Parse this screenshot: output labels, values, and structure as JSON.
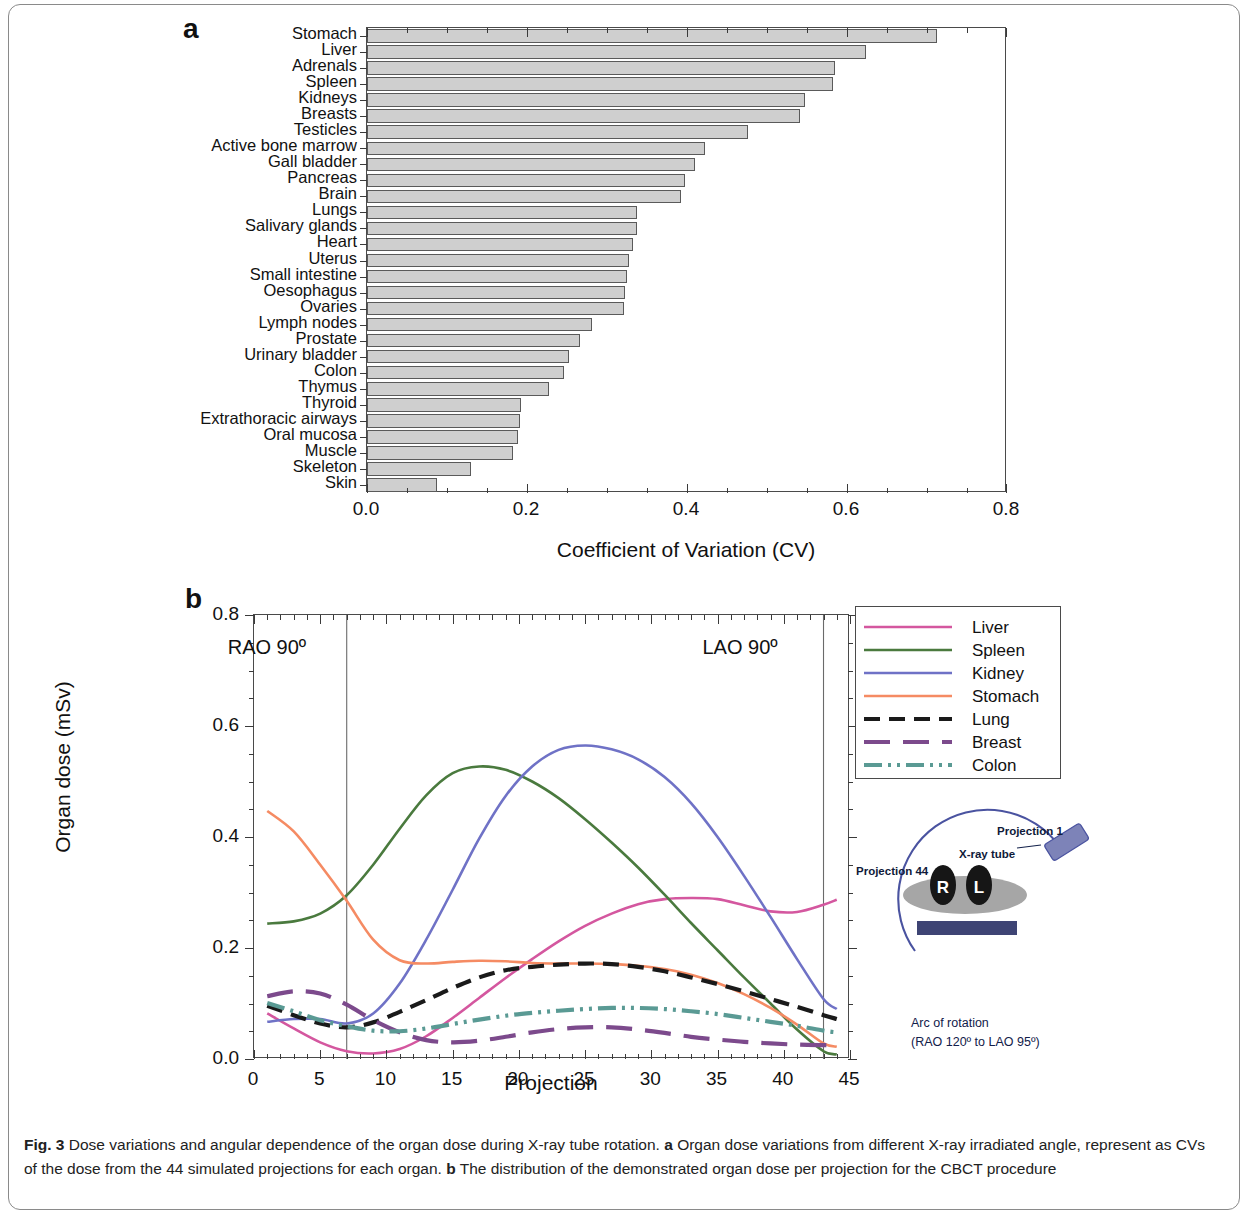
{
  "figure": {
    "caption_label": "Fig. 3",
    "caption_text": " Dose variations and angular dependence of the organ dose during X-ray tube rotation. ",
    "caption_a_label": "a",
    "caption_a_text": " Organ dose variations from different X-ray irradiated angle, represent as CVs of the dose from the 44 simulated projections for each organ. ",
    "caption_b_label": "b",
    "caption_b_text": " The distribution of the demonstrated organ dose per projection for the CBCT procedure"
  },
  "panel_a": {
    "letter": "a",
    "bar_color": "#cfcfcf",
    "bar_edge": "#5a5a5a"
  },
  "panel_b": {
    "letter": "b",
    "annotations": [
      {
        "text": "RAO 90º",
        "projection": 7
      },
      {
        "text": "LAO 90º",
        "projection": 43
      }
    ],
    "inset": {
      "projection1_label": "Projection 1",
      "projection44_label": "Projection 44",
      "xray_tube_label": "X-ray tube",
      "right_marker": "R",
      "left_marker": "L",
      "arc_label_line1": "Arc of rotation",
      "arc_label_line2": "(RAO 120º to LAO 95º)"
    }
  },
  "chart_data": [
    {
      "type": "bar",
      "orientation": "horizontal",
      "title": "",
      "xlabel": "Coefficient of Variation (CV)",
      "ylabel": "",
      "xlim": [
        0.0,
        0.8
      ],
      "xticks": [
        "0.0",
        "0.2",
        "0.4",
        "0.6",
        "0.8"
      ],
      "xtick_values": [
        0.0,
        0.2,
        0.4,
        0.6,
        0.8
      ],
      "grid": false,
      "categories": [
        "Stomach",
        "Liver",
        "Adrenals",
        "Spleen",
        "Kidneys",
        "Breasts",
        "Testicles",
        "Active bone marrow",
        "Gall bladder",
        "Pancreas",
        "Brain",
        "Lungs",
        "Salivary glands",
        "Heart",
        "Uterus",
        "Small intestine",
        "Oesophagus",
        "Ovaries",
        "Lymph nodes",
        "Prostate",
        "Urinary bladder",
        "Colon",
        "Thymus",
        "Thyroid",
        "Extrathoracic airways",
        "Oral mucosa",
        "Muscle",
        "Skeleton",
        "Skin"
      ],
      "values": [
        0.713,
        0.624,
        0.585,
        0.583,
        0.548,
        0.541,
        0.476,
        0.422,
        0.41,
        0.398,
        0.392,
        0.338,
        0.337,
        0.332,
        0.327,
        0.325,
        0.322,
        0.321,
        0.281,
        0.266,
        0.252,
        0.246,
        0.228,
        0.193,
        0.191,
        0.189,
        0.182,
        0.13,
        0.088
      ]
    },
    {
      "type": "line",
      "title": "",
      "xlabel": "Projection",
      "ylabel": "Organ dose (mSv)",
      "xlim": [
        0,
        45
      ],
      "ylim": [
        0.0,
        0.8
      ],
      "xticks": [
        "0",
        "5",
        "10",
        "15",
        "20",
        "25",
        "30",
        "35",
        "40",
        "45"
      ],
      "xtick_values": [
        0,
        5,
        10,
        15,
        20,
        25,
        30,
        35,
        40,
        45
      ],
      "yticks": [
        "0.0",
        "0.2",
        "0.4",
        "0.6",
        "0.8"
      ],
      "ytick_values": [
        0.0,
        0.2,
        0.4,
        0.6,
        0.8
      ],
      "grid": false,
      "legend_position": "right-top",
      "x": [
        1,
        3,
        5,
        7,
        9,
        11,
        13,
        15,
        17,
        19,
        21,
        23,
        25,
        27,
        29,
        31,
        33,
        35,
        37,
        39,
        41,
        43,
        44
      ],
      "series": [
        {
          "name": "Liver",
          "color": "#d4579f",
          "style": "solid",
          "values": [
            0.082,
            0.055,
            0.03,
            0.014,
            0.01,
            0.018,
            0.041,
            0.074,
            0.11,
            0.146,
            0.18,
            0.212,
            0.24,
            0.262,
            0.279,
            0.288,
            0.29,
            0.288,
            0.277,
            0.266,
            0.265,
            0.278,
            0.287
          ]
        },
        {
          "name": "Spleen",
          "color": "#4a7a3e",
          "style": "solid",
          "values": [
            0.244,
            0.248,
            0.262,
            0.295,
            0.35,
            0.415,
            0.475,
            0.515,
            0.527,
            0.521,
            0.5,
            0.47,
            0.432,
            0.39,
            0.345,
            0.296,
            0.245,
            0.196,
            0.147,
            0.1,
            0.053,
            0.014,
            0.008
          ]
        },
        {
          "name": "Kidney",
          "color": "#6f72c6",
          "style": "solid",
          "values": [
            0.067,
            0.072,
            0.072,
            0.064,
            0.082,
            0.136,
            0.215,
            0.305,
            0.397,
            0.474,
            0.527,
            0.557,
            0.565,
            0.558,
            0.54,
            0.508,
            0.461,
            0.4,
            0.33,
            0.256,
            0.18,
            0.108,
            0.09
          ]
        },
        {
          "name": "Stomach",
          "color": "#f58b63",
          "style": "solid",
          "values": [
            0.447,
            0.41,
            0.35,
            0.285,
            0.215,
            0.178,
            0.172,
            0.175,
            0.177,
            0.176,
            0.173,
            0.172,
            0.172,
            0.171,
            0.168,
            0.162,
            0.152,
            0.137,
            0.117,
            0.092,
            0.062,
            0.028,
            0.022
          ]
        },
        {
          "name": "Lung",
          "color": "#1a1a1a",
          "style": "dashed",
          "values": [
            0.096,
            0.079,
            0.064,
            0.057,
            0.066,
            0.085,
            0.106,
            0.128,
            0.147,
            0.16,
            0.166,
            0.17,
            0.172,
            0.171,
            0.166,
            0.158,
            0.147,
            0.135,
            0.122,
            0.108,
            0.094,
            0.079,
            0.072
          ]
        },
        {
          "name": "Breast",
          "color": "#7c4a8c",
          "style": "longdash",
          "values": [
            0.113,
            0.122,
            0.118,
            0.098,
            0.07,
            0.048,
            0.034,
            0.03,
            0.033,
            0.04,
            0.048,
            0.054,
            0.057,
            0.057,
            0.053,
            0.047,
            0.04,
            0.035,
            0.031,
            0.028,
            0.026,
            0.025,
            0.026
          ]
        },
        {
          "name": "Colon",
          "color": "#5a9a94",
          "style": "dashdotdot",
          "values": [
            0.101,
            0.086,
            0.07,
            0.059,
            0.051,
            0.05,
            0.055,
            0.063,
            0.071,
            0.078,
            0.083,
            0.087,
            0.09,
            0.092,
            0.092,
            0.09,
            0.086,
            0.081,
            0.074,
            0.067,
            0.06,
            0.051,
            0.048
          ]
        }
      ]
    }
  ]
}
